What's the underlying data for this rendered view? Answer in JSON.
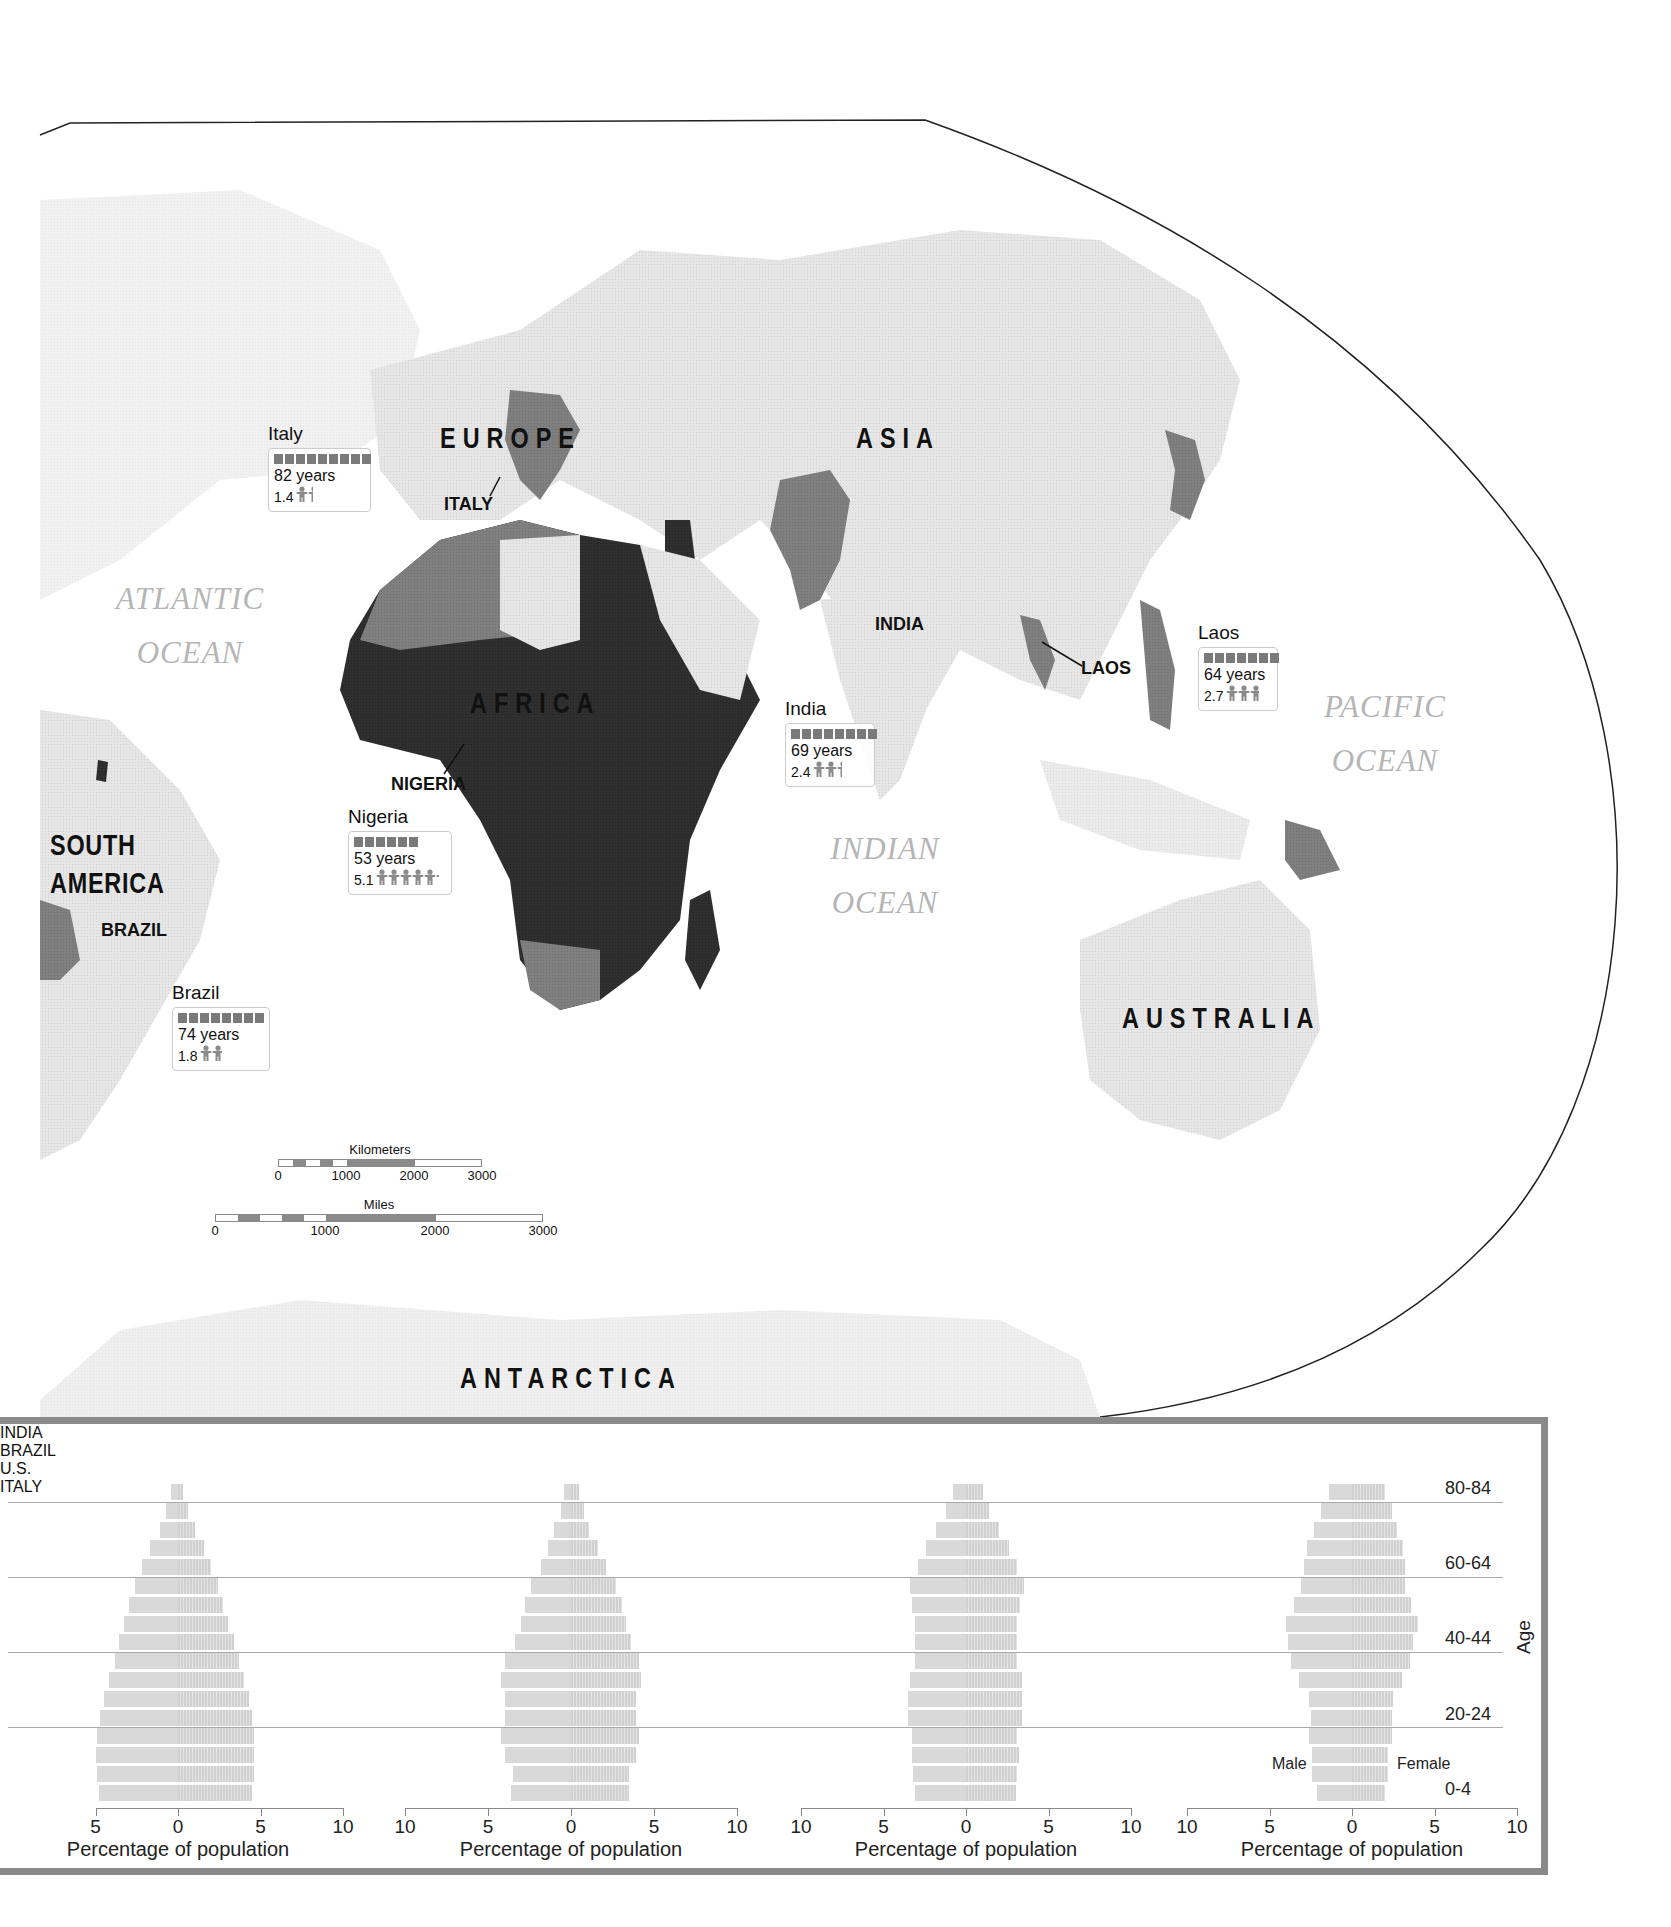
{
  "map": {
    "continents": {
      "europe": "EUROPE",
      "asia": "ASIA",
      "africa": "AFRICA",
      "south_america": "SOUTH AMERICA",
      "australia": "AUSTRALIA",
      "antarctica": "ANTARCTICA"
    },
    "oceans": {
      "atlantic": [
        "ATLANTIC",
        "OCEAN"
      ],
      "indian": [
        "INDIAN",
        "OCEAN"
      ],
      "pacific": [
        "PACIFIC",
        "OCEAN"
      ]
    },
    "country_labels": {
      "italy": "ITALY",
      "nigeria": "NIGERIA",
      "india": "INDIA",
      "laos": "LAOS",
      "brazil": "BRAZIL"
    },
    "callouts": [
      {
        "country": "Italy",
        "life_expectancy": "82 years",
        "fertility": "1.4",
        "bar_segments": 9,
        "people": 1.4
      },
      {
        "country": "Nigeria",
        "life_expectancy": "53 years",
        "fertility": "5.1",
        "bar_segments": 6,
        "people": 5.1
      },
      {
        "country": "India",
        "life_expectancy": "69 years",
        "fertility": "2.4",
        "bar_segments": 8,
        "people": 2.4
      },
      {
        "country": "Laos",
        "life_expectancy": "64 years",
        "fertility": "2.7",
        "bar_segments": 7,
        "people": 2.7
      },
      {
        "country": "Brazil",
        "life_expectancy": "74 years",
        "fertility": "1.8",
        "bar_segments": 8,
        "people": 1.8
      }
    ],
    "scale_bars": {
      "kilometers": {
        "label": "Kilometers",
        "ticks": [
          "0",
          "1000",
          "2000",
          "3000"
        ]
      },
      "miles": {
        "label": "Miles",
        "ticks": [
          "0",
          "1000",
          "2000",
          "3000"
        ]
      }
    },
    "colors": {
      "land_light": "#e3e3e3",
      "land_medium": "#7d7d7d",
      "land_dark": "#2e2e2e",
      "ocean": "#ffffff"
    }
  },
  "chart_data": [
    {
      "type": "bar",
      "subtype": "population-pyramid",
      "title": "INDIA",
      "categories": [
        "0-4",
        "5-9",
        "10-14",
        "15-19",
        "20-24",
        "25-29",
        "30-34",
        "35-39",
        "40-44",
        "45-49",
        "50-54",
        "55-59",
        "60-64",
        "65-69",
        "70-74",
        "75-79",
        "80-84"
      ],
      "series": [
        {
          "name": "Male",
          "values": [
            4.8,
            4.9,
            5.0,
            4.9,
            4.7,
            4.5,
            4.2,
            3.8,
            3.6,
            3.3,
            3.0,
            2.6,
            2.2,
            1.7,
            1.1,
            0.7,
            0.4
          ]
        },
        {
          "name": "Female",
          "values": [
            4.5,
            4.6,
            4.6,
            4.6,
            4.5,
            4.3,
            4.0,
            3.7,
            3.4,
            3.0,
            2.7,
            2.4,
            2.0,
            1.6,
            1.0,
            0.6,
            0.3
          ]
        }
      ],
      "xlabel": "Percentage of population",
      "x_ticks": [
        "5",
        "0",
        "5",
        "10"
      ],
      "xlim": [
        -5,
        10
      ]
    },
    {
      "type": "bar",
      "subtype": "population-pyramid",
      "title": "BRAZIL",
      "categories": [
        "0-4",
        "5-9",
        "10-14",
        "15-19",
        "20-24",
        "25-29",
        "30-34",
        "35-39",
        "40-44",
        "45-49",
        "50-54",
        "55-59",
        "60-64",
        "65-69",
        "70-74",
        "75-79",
        "80-84"
      ],
      "series": [
        {
          "name": "Male",
          "values": [
            3.6,
            3.5,
            4.0,
            4.2,
            4.0,
            4.0,
            4.2,
            4.0,
            3.4,
            3.0,
            2.8,
            2.4,
            1.8,
            1.4,
            1.0,
            0.6,
            0.4
          ]
        },
        {
          "name": "Female",
          "values": [
            3.5,
            3.5,
            3.9,
            4.1,
            3.9,
            3.9,
            4.2,
            4.1,
            3.6,
            3.3,
            3.1,
            2.7,
            2.1,
            1.6,
            1.1,
            0.8,
            0.5
          ]
        }
      ],
      "xlabel": "Percentage of population",
      "x_ticks": [
        "10",
        "5",
        "0",
        "5",
        "10"
      ],
      "xlim": [
        -10,
        10
      ]
    },
    {
      "type": "bar",
      "subtype": "population-pyramid",
      "title": "U.S.",
      "categories": [
        "0-4",
        "5-9",
        "10-14",
        "15-19",
        "20-24",
        "25-29",
        "30-34",
        "35-39",
        "40-44",
        "45-49",
        "50-54",
        "55-59",
        "60-64",
        "65-69",
        "70-74",
        "75-79",
        "80-84"
      ],
      "series": [
        {
          "name": "Male",
          "values": [
            3.1,
            3.2,
            3.3,
            3.3,
            3.5,
            3.5,
            3.4,
            3.1,
            3.1,
            3.1,
            3.3,
            3.4,
            2.9,
            2.4,
            1.8,
            1.2,
            0.8
          ]
        },
        {
          "name": "Female",
          "values": [
            3.0,
            3.1,
            3.2,
            3.1,
            3.4,
            3.4,
            3.4,
            3.1,
            3.1,
            3.1,
            3.3,
            3.5,
            3.1,
            2.6,
            2.0,
            1.4,
            1.0
          ]
        }
      ],
      "xlabel": "Percentage of population",
      "x_ticks": [
        "10",
        "5",
        "0",
        "5",
        "10"
      ],
      "xlim": [
        -10,
        10
      ]
    },
    {
      "type": "bar",
      "subtype": "population-pyramid",
      "title": "ITALY",
      "categories": [
        "0-4",
        "5-9",
        "10-14",
        "15-19",
        "20-24",
        "25-29",
        "30-34",
        "35-39",
        "40-44",
        "45-49",
        "50-54",
        "55-59",
        "60-64",
        "65-69",
        "70-74",
        "75-79",
        "80-84"
      ],
      "series": [
        {
          "name": "Male",
          "values": [
            2.1,
            2.4,
            2.4,
            2.6,
            2.5,
            2.6,
            3.2,
            3.7,
            3.9,
            4.0,
            3.5,
            3.1,
            2.9,
            2.7,
            2.3,
            1.9,
            1.4
          ]
        },
        {
          "name": "Female",
          "values": [
            2.0,
            2.2,
            2.2,
            2.4,
            2.4,
            2.5,
            3.0,
            3.5,
            3.7,
            4.0,
            3.6,
            3.2,
            3.2,
            3.1,
            2.7,
            2.4,
            2.0
          ]
        }
      ],
      "xlabel": "Percentage of population",
      "x_ticks": [
        "10",
        "5",
        "0",
        "5",
        "10"
      ],
      "xlim": [
        -10,
        10
      ],
      "legend": {
        "male": "Male",
        "female": "Female"
      },
      "age_labels": [
        "80-84",
        "60-64",
        "40-44",
        "20-24",
        "0-4"
      ],
      "ylabel": "Age"
    }
  ]
}
